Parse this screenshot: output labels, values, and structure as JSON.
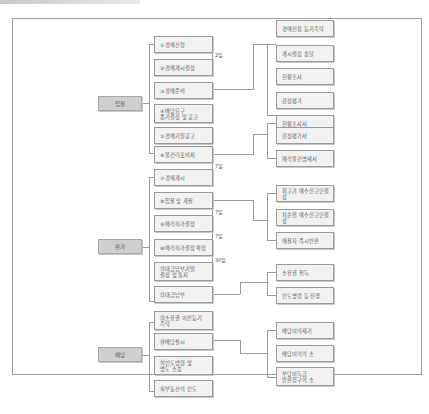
{
  "categories": [
    {
      "id": "bidding",
      "label": "입찰"
    },
    {
      "id": "conversion",
      "label": "환가"
    },
    {
      "id": "distribution",
      "label": "배당"
    }
  ],
  "steps": [
    {
      "label": "①경매신청"
    },
    {
      "label": "②경매개시결정"
    },
    {
      "label": "③경매준비"
    },
    {
      "label": "④배당요구\n종기결정 및 공고"
    },
    {
      "label": "⑤경매기일공고"
    },
    {
      "label": "⑥물건리포비치"
    },
    {
      "label": "⑦경매개시"
    },
    {
      "label": "⑧입찰 및 개찰"
    },
    {
      "label": "⑨매각허가결정"
    },
    {
      "label": "⑩매각허가결정 확정"
    },
    {
      "label": "⑪대금납부기일\n결정 및 통지"
    },
    {
      "label": "⑫대금납부"
    },
    {
      "label": "⑬소유권 이전등기\n촉탁"
    },
    {
      "label": "⑭배당실시"
    },
    {
      "label": "⑮인도명령 및\n명도 소송"
    },
    {
      "label": "⑯부동산의 인도"
    }
  ],
  "details": [
    {
      "label": "경매신청 등기촉탁"
    },
    {
      "label": "개시결정 송달"
    },
    {
      "label": "현황조사"
    },
    {
      "label": "감정평가"
    },
    {
      "label": "현황조사서"
    },
    {
      "label": "감정평가서"
    },
    {
      "label": "매각물건명세서"
    },
    {
      "label": "최고가 매수신고인결정"
    },
    {
      "label": "차순위 매수신고인결정"
    },
    {
      "label": "매찰자 즉시반환"
    },
    {
      "label": "소유권 취득"
    },
    {
      "label": "인도명령 등 진행"
    },
    {
      "label": "배당이의제기"
    },
    {
      "label": "배당이의의 소"
    },
    {
      "label": "부당이득금\n반환청구의 소"
    }
  ],
  "intervals": [
    {
      "label": "2일"
    },
    {
      "label": "7일"
    },
    {
      "label": "7일"
    },
    {
      "label": "7일"
    },
    {
      "label": "30일"
    }
  ]
}
